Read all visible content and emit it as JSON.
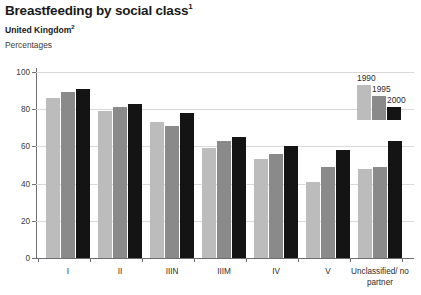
{
  "header": {
    "title": "Breastfeeding by social class",
    "title_footnote": "1",
    "subtitle": "United Kingdom",
    "subtitle_footnote": "2",
    "units": "Percentages"
  },
  "legend": {
    "position": "top-right",
    "entries": [
      {
        "label": "1990",
        "color": "#bcbcbc"
      },
      {
        "label": "1995",
        "color": "#8a8a8a"
      },
      {
        "label": "2000",
        "color": "#141414"
      }
    ]
  },
  "axes": {
    "y_ticks": [
      "0",
      "20",
      "40",
      "60",
      "80",
      "100"
    ],
    "x_labels": [
      "I",
      "II",
      "IIIN",
      "IIIM",
      "IV",
      "V",
      "Unclassified/ no partner"
    ]
  },
  "chart_data": {
    "type": "bar",
    "title": "Breastfeeding by social class",
    "subtitle": "United Kingdom",
    "xlabel": "",
    "ylabel": "Percentages",
    "ylim": [
      0,
      100
    ],
    "yticks": [
      0,
      20,
      40,
      60,
      80,
      100
    ],
    "grid": true,
    "legend_position": "top-right",
    "categories": [
      "I",
      "II",
      "IIIN",
      "IIIM",
      "IV",
      "V",
      "Unclassified/no partner"
    ],
    "series": [
      {
        "name": "1990",
        "color": "#bcbcbc",
        "values": [
          86,
          79,
          73,
          59,
          53,
          41,
          48
        ]
      },
      {
        "name": "1995",
        "color": "#8a8a8a",
        "values": [
          89,
          81,
          71,
          63,
          56,
          49,
          49
        ]
      },
      {
        "name": "2000",
        "color": "#141414",
        "values": [
          91,
          83,
          78,
          65,
          60,
          58,
          63
        ]
      }
    ]
  }
}
